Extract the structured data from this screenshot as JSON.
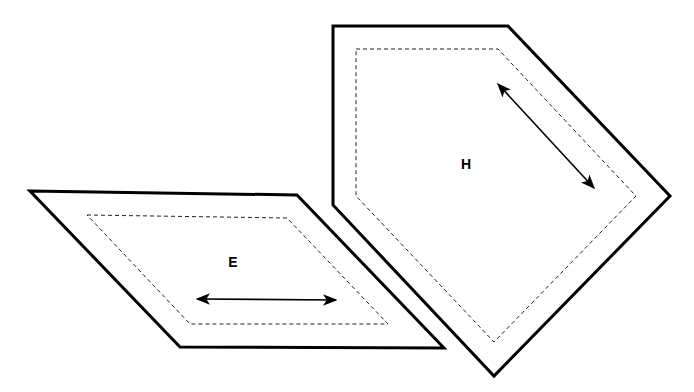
{
  "diagram": {
    "shapes": [
      {
        "id": "E",
        "label": "E",
        "outer": "30,191 297,195 444,348 180,347",
        "inner": "87,215 287,218 388,324 190,324",
        "label_pos": [
          233,
          267
        ],
        "arrow": [
          197,
          299,
          336,
          300
        ]
      },
      {
        "id": "H",
        "label": "H",
        "outer": "333,26 508,26 670,196 494,376 333,205",
        "inner": "356,49 498,49 636,196 494,342 356,196",
        "label_pos": [
          466,
          169
        ],
        "arrow": [
          498,
          84,
          594,
          188
        ]
      }
    ],
    "colors": {
      "stroke": "#000000",
      "background": "#ffffff"
    }
  }
}
